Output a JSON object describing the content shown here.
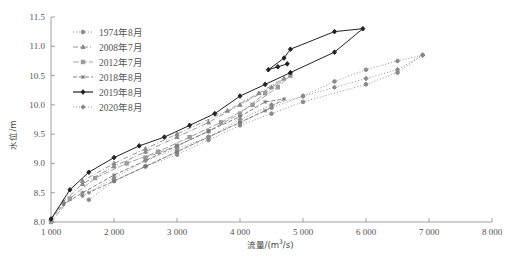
{
  "chart_data": {
    "type": "line",
    "title": "",
    "xlabel": "流量/(m³/s)",
    "xlabel_parts": {
      "prefix": "流量/(m",
      "sup": "3",
      "suffix": "/s)"
    },
    "ylabel": "水位/m",
    "xlim": [
      1000,
      8000
    ],
    "ylim": [
      8.0,
      11.5
    ],
    "x_ticks": [
      1000,
      2000,
      3000,
      4000,
      5000,
      6000,
      7000,
      8000
    ],
    "x_tick_labels": [
      "1 000",
      "2 000",
      "3 000",
      "4 000",
      "5 000",
      "6 000",
      "7 000",
      "8 000"
    ],
    "y_ticks": [
      8.0,
      8.5,
      9.0,
      9.5,
      10.0,
      10.5,
      11.0,
      11.5
    ],
    "y_tick_labels": [
      "8.0",
      "8.5",
      "9.0",
      "9.5",
      "10.0",
      "10.5",
      "11.0",
      "11.5"
    ],
    "grid": false,
    "legend_position": "top-left",
    "series": [
      {
        "name": "1974年8月",
        "style": "dotted",
        "marker": "circle",
        "color": "#8a8a8a",
        "points": [
          [
            1600,
            8.38
          ],
          [
            2000,
            8.7
          ],
          [
            2500,
            8.95
          ],
          [
            3000,
            9.2
          ],
          [
            3500,
            9.45
          ],
          [
            4000,
            9.7
          ],
          [
            4500,
            9.95
          ],
          [
            5000,
            10.15
          ],
          [
            5500,
            10.4
          ],
          [
            6000,
            10.6
          ],
          [
            6500,
            10.75
          ],
          [
            6900,
            10.85
          ],
          [
            6500,
            10.55
          ],
          [
            6000,
            10.35
          ],
          [
            5000,
            10.05
          ],
          [
            4500,
            9.85
          ],
          [
            4000,
            9.65
          ],
          [
            3500,
            9.4
          ],
          [
            3000,
            9.15
          ],
          [
            2500,
            8.95
          ],
          [
            2000,
            8.7
          ]
        ]
      },
      {
        "name": "2008年7月",
        "style": "dash-dot",
        "marker": "triangle",
        "color": "#8a8a8a",
        "points": [
          [
            1000,
            8.05
          ],
          [
            1200,
            8.35
          ],
          [
            1500,
            8.65
          ],
          [
            2000,
            8.95
          ],
          [
            2500,
            9.2
          ],
          [
            3000,
            9.45
          ],
          [
            3500,
            9.7
          ],
          [
            4000,
            10.0
          ],
          [
            4500,
            10.3
          ],
          [
            4700,
            10.45
          ],
          [
            4300,
            10.2
          ],
          [
            3800,
            9.9
          ],
          [
            3000,
            9.5
          ],
          [
            2500,
            9.25
          ],
          [
            2000,
            9.0
          ],
          [
            1500,
            8.7
          ]
        ]
      },
      {
        "name": "2012年7月",
        "style": "long-dash",
        "marker": "square",
        "color": "#9a9a9a",
        "points": [
          [
            1000,
            8.0
          ],
          [
            1300,
            8.4
          ],
          [
            1700,
            8.75
          ],
          [
            2200,
            9.0
          ],
          [
            2700,
            9.2
          ],
          [
            3200,
            9.45
          ],
          [
            3700,
            9.7
          ],
          [
            4200,
            10.0
          ],
          [
            4600,
            10.3
          ],
          [
            4800,
            10.5
          ],
          [
            4400,
            10.2
          ],
          [
            4000,
            9.85
          ],
          [
            3500,
            9.55
          ],
          [
            3000,
            9.3
          ],
          [
            2500,
            9.1
          ]
        ]
      },
      {
        "name": "2018年8月",
        "style": "dashed",
        "marker": "asterisk",
        "color": "#777777",
        "points": [
          [
            1000,
            8.05
          ],
          [
            1200,
            8.3
          ],
          [
            1500,
            8.5
          ],
          [
            2000,
            8.8
          ],
          [
            2500,
            9.05
          ],
          [
            3000,
            9.3
          ],
          [
            3500,
            9.55
          ],
          [
            4000,
            9.8
          ],
          [
            4400,
            10.05
          ],
          [
            4700,
            10.1
          ],
          [
            4400,
            9.9
          ],
          [
            4000,
            9.7
          ],
          [
            3500,
            9.45
          ],
          [
            3000,
            9.2
          ],
          [
            2500,
            8.95
          ],
          [
            2000,
            8.7
          ],
          [
            1600,
            8.5
          ]
        ]
      },
      {
        "name": "2019年8月",
        "style": "solid",
        "marker": "diamond",
        "color": "#222222",
        "points": [
          [
            1000,
            8.05
          ],
          [
            1300,
            8.55
          ],
          [
            1600,
            8.85
          ],
          [
            2000,
            9.1
          ],
          [
            2400,
            9.3
          ],
          [
            2800,
            9.45
          ],
          [
            3200,
            9.65
          ],
          [
            3600,
            9.85
          ],
          [
            4000,
            10.15
          ],
          [
            4400,
            10.35
          ],
          [
            4800,
            10.55
          ],
          [
            5500,
            10.9
          ],
          [
            5950,
            11.3
          ],
          [
            5500,
            11.25
          ],
          [
            4800,
            10.95
          ],
          [
            4700,
            10.8
          ],
          [
            4450,
            10.6
          ],
          [
            4600,
            10.65
          ],
          [
            4750,
            10.7
          ]
        ]
      },
      {
        "name": "2020年8月",
        "style": "dotted",
        "marker": "diamond",
        "color": "#8a8a8a",
        "points": [
          [
            1500,
            8.45
          ],
          [
            2000,
            8.75
          ],
          [
            2500,
            9.05
          ],
          [
            3000,
            9.25
          ],
          [
            3500,
            9.45
          ],
          [
            4000,
            9.75
          ],
          [
            4500,
            10.0
          ],
          [
            5000,
            10.15
          ],
          [
            5500,
            10.3
          ],
          [
            6000,
            10.45
          ],
          [
            6500,
            10.6
          ],
          [
            6900,
            10.85
          ]
        ]
      }
    ]
  }
}
